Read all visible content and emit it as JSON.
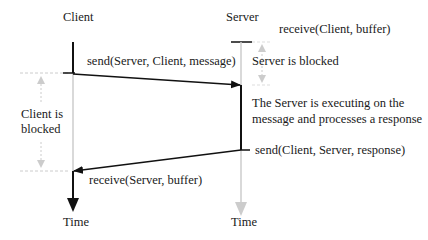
{
  "diagram": {
    "type": "sequence",
    "participants": [
      {
        "name": "Client",
        "time_label": "Time"
      },
      {
        "name": "Server",
        "time_label": "Time"
      }
    ],
    "messages": [
      {
        "label": "send(Server, Client, message)",
        "from": "Client",
        "to": "Server"
      },
      {
        "label": "send(Client, Server, response)",
        "from": "Server",
        "to": "Client"
      }
    ],
    "annotations": {
      "server_receive": "receive(Client, buffer)",
      "server_blocked": "Server is blocked",
      "server_executing_line1": "The Server is executing on the",
      "server_executing_line2": "message and processes a response",
      "client_blocked_line1": "Client is",
      "client_blocked_line2": "blocked",
      "client_receive": "receive(Server, buffer)"
    },
    "colors": {
      "active": "#111111",
      "inactive": "#cccccc",
      "text": "#1a1a1a"
    }
  }
}
